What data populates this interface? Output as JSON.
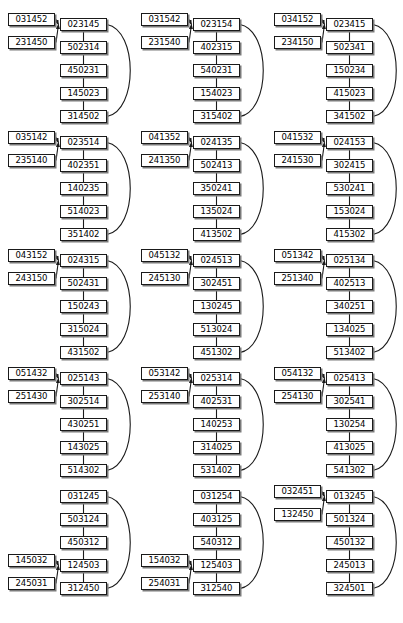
{
  "figure": {
    "type": "state-transition-diagram-grid",
    "rows": 5,
    "columns": 3,
    "total_diagrams": 15,
    "chain_length": 5,
    "side_node_count": 2
  },
  "diagrams": [
    {
      "id": "diagram-1",
      "row": 1,
      "col": 1,
      "side_attach_index": 0,
      "side_nodes": [
        "031452",
        "231450"
      ],
      "chain": [
        "023145",
        "502314",
        "450231",
        "145023",
        "314502"
      ]
    },
    {
      "id": "diagram-2",
      "row": 1,
      "col": 2,
      "side_attach_index": 0,
      "side_nodes": [
        "031542",
        "231540"
      ],
      "chain": [
        "023154",
        "402315",
        "540231",
        "154023",
        "315402"
      ]
    },
    {
      "id": "diagram-3",
      "row": 1,
      "col": 3,
      "side_attach_index": 0,
      "side_nodes": [
        "034152",
        "234150"
      ],
      "chain": [
        "023415",
        "502341",
        "150234",
        "415023",
        "341502"
      ]
    },
    {
      "id": "diagram-4",
      "row": 2,
      "col": 1,
      "side_attach_index": 0,
      "side_nodes": [
        "035142",
        "235140"
      ],
      "chain": [
        "023514",
        "402351",
        "140235",
        "514023",
        "351402"
      ]
    },
    {
      "id": "diagram-5",
      "row": 2,
      "col": 2,
      "side_attach_index": 0,
      "side_nodes": [
        "041352",
        "241350"
      ],
      "chain": [
        "024135",
        "502413",
        "350241",
        "135024",
        "413502"
      ]
    },
    {
      "id": "diagram-6",
      "row": 2,
      "col": 3,
      "side_attach_index": 0,
      "side_nodes": [
        "041532",
        "241530"
      ],
      "chain": [
        "024153",
        "302415",
        "530241",
        "153024",
        "415302"
      ]
    },
    {
      "id": "diagram-7",
      "row": 3,
      "col": 1,
      "side_attach_index": 0,
      "side_nodes": [
        "043152",
        "243150"
      ],
      "chain": [
        "024315",
        "502431",
        "150243",
        "315024",
        "431502"
      ]
    },
    {
      "id": "diagram-8",
      "row": 3,
      "col": 2,
      "side_attach_index": 0,
      "side_nodes": [
        "045132",
        "245130"
      ],
      "chain": [
        "024513",
        "302451",
        "130245",
        "513024",
        "451302"
      ]
    },
    {
      "id": "diagram-9",
      "row": 3,
      "col": 3,
      "side_attach_index": 0,
      "side_nodes": [
        "051342",
        "251340"
      ],
      "chain": [
        "025134",
        "402513",
        "340251",
        "134025",
        "513402"
      ]
    },
    {
      "id": "diagram-10",
      "row": 4,
      "col": 1,
      "side_attach_index": 0,
      "side_nodes": [
        "051432",
        "251430"
      ],
      "chain": [
        "025143",
        "302514",
        "430251",
        "143025",
        "514302"
      ]
    },
    {
      "id": "diagram-11",
      "row": 4,
      "col": 2,
      "side_attach_index": 0,
      "side_nodes": [
        "053142",
        "253140"
      ],
      "chain": [
        "025314",
        "402531",
        "140253",
        "314025",
        "531402"
      ]
    },
    {
      "id": "diagram-12",
      "row": 4,
      "col": 3,
      "side_attach_index": 0,
      "side_nodes": [
        "054132",
        "254130"
      ],
      "chain": [
        "025413",
        "302541",
        "130254",
        "413025",
        "541302"
      ]
    },
    {
      "id": "diagram-13",
      "row": 5,
      "col": 1,
      "side_attach_index": 3,
      "side_nodes": [
        "145032",
        "245031"
      ],
      "chain": [
        "031245",
        "503124",
        "450312",
        "124503",
        "312450"
      ]
    },
    {
      "id": "diagram-14",
      "row": 5,
      "col": 2,
      "side_attach_index": 3,
      "side_nodes": [
        "154032",
        "254031"
      ],
      "chain": [
        "031254",
        "403125",
        "540312",
        "125403",
        "312540"
      ]
    },
    {
      "id": "diagram-15",
      "row": 5,
      "col": 3,
      "side_attach_index": 0,
      "side_nodes": [
        "032451",
        "132450"
      ],
      "chain": [
        "013245",
        "501324",
        "450132",
        "245013",
        "324501"
      ]
    }
  ],
  "layout": {
    "grid_origin_x": 8,
    "grid_origin_y": 14,
    "col_step": 133,
    "row_step": 118,
    "node_width": 47,
    "node_height": 13,
    "chain_row_step": 23,
    "chain_left": 52,
    "side_left": 0
  },
  "style": {
    "background": "#ffffff",
    "node_fill": "#ffffff",
    "node_border": "#1a1a1a",
    "node_shadow": "#7a7a7a",
    "edge_color": "#1a1a1a",
    "text_color": "#000000"
  }
}
